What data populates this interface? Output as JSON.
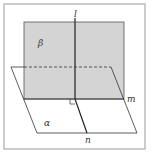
{
  "diagram": {
    "labels": {
      "l": "l",
      "beta": "β",
      "alpha": "α",
      "m": "m",
      "n": "n"
    },
    "colors": {
      "plane_beta_fill": "#d4d4d4",
      "stroke": "#333333",
      "frame": "#999999"
    }
  }
}
